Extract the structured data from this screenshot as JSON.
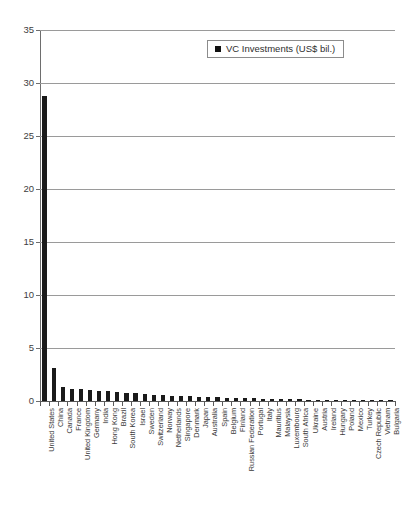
{
  "chart_data": {
    "type": "bar",
    "title": "",
    "xlabel": "",
    "ylabel": "",
    "ylim": [
      0,
      35
    ],
    "ytick_step": 5,
    "yticks": [
      "0",
      "5",
      "10",
      "15",
      "20",
      "25",
      "30",
      "35"
    ],
    "grid": true,
    "legend_position": "top-center",
    "series_name": "VC Investments (US$ bil.)",
    "bar_color": "#1a1a1a",
    "categories": [
      "United States",
      "China",
      "Canada",
      "France",
      "United Kingdom",
      "Germany",
      "India",
      "Hong Kong",
      "Brazil",
      "South Korea",
      "Israel",
      "Sweden",
      "Switzerland",
      "Norway",
      "Netherlands",
      "Singapore",
      "Denmark",
      "Japan",
      "Australia",
      "Spain",
      "Belgium",
      "Finland",
      "Russian Federation",
      "Portugal",
      "Italy",
      "Mauritius",
      "Malaysia",
      "Luxembourg",
      "South Africa",
      "Ukraine",
      "Austria",
      "Ireland",
      "Hungary",
      "Poland",
      "Mexico",
      "Turkey",
      "Czech Republic",
      "Vietnam",
      "Bulgaria"
    ],
    "values": [
      28.8,
      3.1,
      1.35,
      1.15,
      1.1,
      1.0,
      0.95,
      0.9,
      0.85,
      0.8,
      0.72,
      0.66,
      0.6,
      0.56,
      0.52,
      0.48,
      0.44,
      0.4,
      0.37,
      0.34,
      0.31,
      0.28,
      0.26,
      0.24,
      0.22,
      0.2,
      0.18,
      0.16,
      0.15,
      0.13,
      0.12,
      0.11,
      0.1,
      0.09,
      0.08,
      0.07,
      0.06,
      0.05,
      0.04
    ]
  },
  "legend": {
    "label": "VC Investments (US$ bil.)"
  }
}
